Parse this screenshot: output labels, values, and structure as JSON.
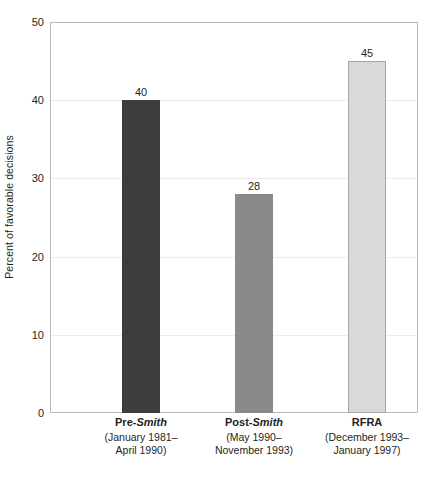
{
  "chart_data": {
    "type": "bar",
    "title": "",
    "subtitle": "",
    "xlabel": "",
    "ylabel": "Percent of favorable decisions",
    "ylim": [
      0,
      50
    ],
    "yticks": [
      0,
      10,
      20,
      30,
      40,
      50
    ],
    "ytick_labels": [
      "0",
      "10",
      "20",
      "30",
      "40",
      "50"
    ],
    "grid": "horizontal",
    "legend": "none",
    "categories": [
      "Pre-Smith",
      "Post-Smith",
      "RFRA"
    ],
    "values": [
      40,
      28,
      45
    ],
    "value_labels": [
      "40",
      "28",
      "45"
    ],
    "bars": [
      {
        "label_main_prefix": "Pre-",
        "label_main_italic": "Smith",
        "label_sub_line1": "(January 1981–",
        "label_sub_line2": "April 1990)",
        "value": 40,
        "value_label": "40",
        "fill": "#3d3d3d",
        "stroke": "#3d3d3d"
      },
      {
        "label_main_prefix": "Post-",
        "label_main_italic": "Smith",
        "label_sub_line1": "(May 1990–",
        "label_sub_line2": "November 1993)",
        "value": 28,
        "value_label": "28",
        "fill": "#8a8a8a",
        "stroke": "#8a8a8a"
      },
      {
        "label_main_prefix": "RFRA",
        "label_main_italic": "",
        "label_sub_line1": "(December 1993–",
        "label_sub_line2": "January 1997)",
        "value": 45,
        "value_label": "45",
        "fill": "#d9d9d9",
        "stroke": "#a6a6a6"
      }
    ]
  },
  "colors": {
    "axis_frame": "#b9b9b9",
    "gridline": "#ececec",
    "text": "#231f20",
    "background": "#ffffff"
  }
}
